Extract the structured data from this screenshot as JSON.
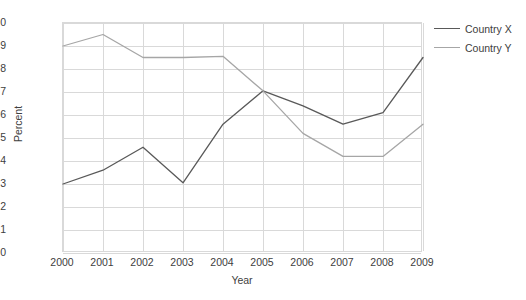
{
  "chart_data": {
    "type": "line",
    "title": "",
    "xlabel": "Year",
    "ylabel": "Percent",
    "categories": [
      "2000",
      "2001",
      "2002",
      "2003",
      "2004",
      "2005",
      "2006",
      "2007",
      "2008",
      "2009"
    ],
    "x": [
      2000,
      2001,
      2002,
      2003,
      2004,
      2005,
      2006,
      2007,
      2008,
      2009
    ],
    "ylim": [
      0,
      10
    ],
    "ytick_labels": [
      "10",
      "9",
      "8",
      "7",
      "6",
      "5",
      "4",
      "3",
      "2",
      "1",
      "0"
    ],
    "yticks": [
      10,
      9,
      8,
      7,
      6,
      5,
      4,
      3,
      2,
      1,
      0
    ],
    "grid": true,
    "legend_position": "right",
    "series": [
      {
        "name": "Country X",
        "color": "#595959",
        "values": [
          3.0,
          3.6,
          4.6,
          3.05,
          5.6,
          7.05,
          6.4,
          5.6,
          6.1,
          8.5
        ]
      },
      {
        "name": "Country Y",
        "color": "#a6a6a6",
        "values": [
          9.0,
          9.5,
          8.5,
          8.5,
          8.55,
          7.05,
          5.2,
          4.2,
          4.2,
          5.6
        ]
      }
    ]
  },
  "axes": {
    "y_title": "Percent",
    "x_title": "Year"
  },
  "colors": {
    "grid": "#d9d9d9",
    "text": "#404040",
    "series_x": "#595959",
    "series_y": "#a6a6a6"
  }
}
